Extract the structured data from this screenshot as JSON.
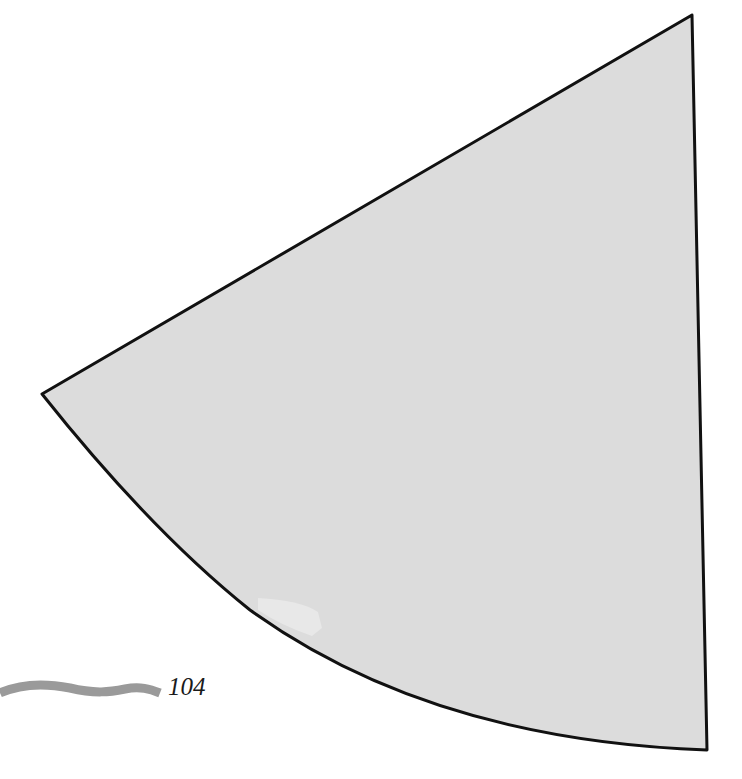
{
  "page": {
    "number": "104"
  },
  "figure": {
    "shape": "circular-sector",
    "fill_color": "#dcdcdc",
    "stroke_color": "#111111"
  },
  "decoration": {
    "squiggle_color": "#9a9a9a"
  }
}
